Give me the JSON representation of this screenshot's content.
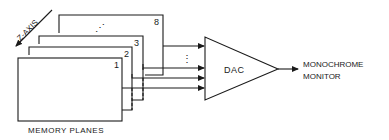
{
  "diagram": {
    "axis_label": "Z-AXIS",
    "memory_planes": {
      "caption": "MEMORY PLANES",
      "planes": [
        {
          "label": "1"
        },
        {
          "label": "2"
        },
        {
          "label": "3"
        },
        {
          "label": "8"
        }
      ],
      "ellipsis_between_planes": "⋰",
      "ellipsis_between_lines": "⋮"
    },
    "converter": {
      "label": "DAC",
      "shape": "triangle"
    },
    "output": {
      "line1": "MONOCHROME",
      "line2": "MONITOR"
    },
    "colors": {
      "stroke": "#1a1a1a",
      "background": "#ffffff"
    }
  }
}
